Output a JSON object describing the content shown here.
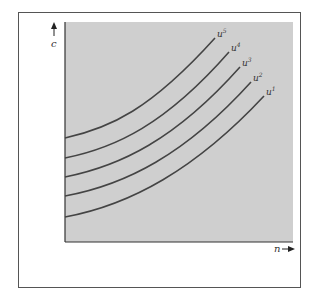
{
  "diagram": {
    "type": "indifference-curves",
    "y_axis_label": "c",
    "x_axis_label": "n",
    "background_color": "#cfcfcf",
    "curve_color": "#444444",
    "curves": [
      {
        "label": "u",
        "sup": "5"
      },
      {
        "label": "u",
        "sup": "4"
      },
      {
        "label": "u",
        "sup": "3"
      },
      {
        "label": "u",
        "sup": "2"
      },
      {
        "label": "u",
        "sup": "1"
      }
    ]
  }
}
